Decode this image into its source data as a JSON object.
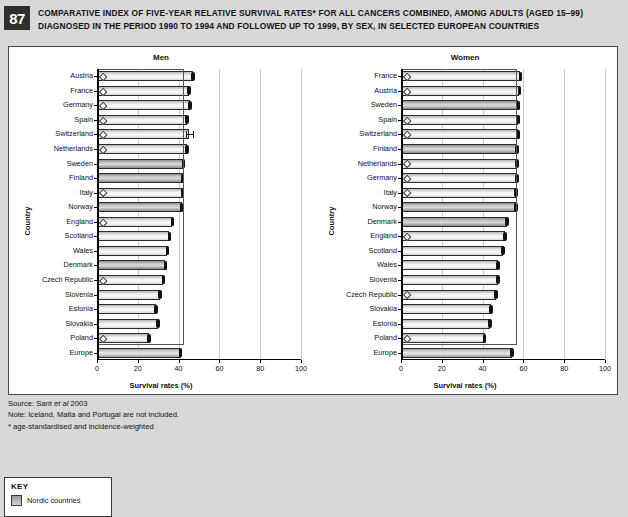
{
  "figure": {
    "number": "87",
    "title_line1": "COMPARATIVE INDEX OF FIVE-YEAR RELATIVE SURVIVAL RATES* FOR ALL CANCERS COMBINED, AMONG ADULTS (AGED 15–99)",
    "title_line2": "DIAGNOSED IN THE PERIOD 1990 TO 1994 AND FOLLOWED UP TO 1999, BY SEX, IN SELECTED EUROPEAN COUNTRIES"
  },
  "notes": {
    "source_prefix": "Source: Sant ",
    "source_italic": "et al",
    "source_suffix": " 2003",
    "note": "Note: Iceland, Malta and Portugal are not included.",
    "footnote": "* age-standardised and incidence-weighted"
  },
  "key": {
    "title": "KEY",
    "items": [
      {
        "label": "Nordic countries",
        "swatch": "#b0b0b0"
      }
    ]
  },
  "colors": {
    "page_background": "#d8d8d8",
    "panel_background": "#ffffff",
    "badge_background": "#2f2f2f",
    "gridline": "#c9c9c9",
    "axis": "#000000",
    "bar_outline": "#2b2b2b"
  },
  "chart_data": [
    {
      "type": "bar",
      "title": "Men",
      "xlabel": "Survival rates (%)",
      "ylabel": "Country",
      "xlim": [
        0,
        100
      ],
      "xticks": [
        0,
        20,
        40,
        60,
        80,
        100
      ],
      "grid": true,
      "orientation": "horizontal",
      "reference_line": 42.0,
      "categories": [
        "Austria",
        "France",
        "Germany",
        "Spain",
        "Switzerland",
        "Netherlands",
        "Sweden",
        "Finland",
        "Italy",
        "Norway",
        "England",
        "Scotland",
        "Wales",
        "Denmark",
        "Czech Republic",
        "Slovenia",
        "Estonia",
        "Slovakia",
        "Poland",
        "Europe"
      ],
      "values": [
        47.0,
        45.0,
        45.5,
        44.0,
        45.0,
        44.0,
        42.5,
        42.0,
        42.0,
        41.5,
        37.0,
        35.5,
        34.5,
        33.5,
        32.5,
        31.0,
        29.0,
        30.0,
        25.5,
        41.0
      ],
      "errors_low": [
        45.5,
        43.5,
        44.0,
        43.2,
        43.5,
        43.2,
        42.0,
        41.5,
        41.5,
        41.0,
        36.0,
        34.8,
        33.8,
        32.8,
        31.0,
        30.0,
        27.8,
        29.4,
        24.2,
        40.5
      ],
      "errors_high": [
        48.5,
        46.5,
        47.0,
        44.8,
        47.0,
        44.8,
        43.0,
        42.5,
        42.5,
        42.0,
        38.0,
        36.2,
        35.2,
        34.2,
        34.0,
        32.0,
        30.2,
        30.6,
        26.8,
        41.5
      ],
      "nordic": [
        "Sweden",
        "Finland",
        "Norway",
        "Denmark"
      ],
      "marked": [
        "Austria",
        "France",
        "Germany",
        "Spain",
        "Switzerland",
        "Netherlands",
        "Italy",
        "England",
        "Czech Republic",
        "Poland"
      ],
      "aggregate": "Europe"
    },
    {
      "type": "bar",
      "title": "Women",
      "xlabel": "Survival rates (%)",
      "ylabel": "Country",
      "xlim": [
        0,
        100
      ],
      "xticks": [
        0,
        20,
        40,
        60,
        80,
        100
      ],
      "grid": true,
      "orientation": "horizontal",
      "reference_line": 56.5,
      "categories": [
        "France",
        "Austria",
        "Sweden",
        "Spain",
        "Switzerland",
        "Finland",
        "Netherlands",
        "Germany",
        "Italy",
        "Norway",
        "Denmark",
        "England",
        "Scotland",
        "Wales",
        "Slovenia",
        "Czech Republic",
        "Slovakia",
        "Estonia",
        "Poland",
        "Europe"
      ],
      "values": [
        58.5,
        58.0,
        57.5,
        57.5,
        57.5,
        57.0,
        57.0,
        57.0,
        56.5,
        56.5,
        52.0,
        51.0,
        50.0,
        47.5,
        47.5,
        46.5,
        44.0,
        43.5,
        41.0,
        54.5
      ],
      "errors_low": [
        57.5,
        56.8,
        57.0,
        56.8,
        56.5,
        56.5,
        56.5,
        56.0,
        56.0,
        56.0,
        51.5,
        50.5,
        49.5,
        47.0,
        46.5,
        45.2,
        43.2,
        42.5,
        40.2,
        54.0
      ],
      "errors_high": [
        59.5,
        59.2,
        58.0,
        58.2,
        58.5,
        57.5,
        57.5,
        58.0,
        57.0,
        57.0,
        52.5,
        51.5,
        50.5,
        48.0,
        48.5,
        47.8,
        44.8,
        44.5,
        41.8,
        55.0
      ],
      "nordic": [
        "Sweden",
        "Finland",
        "Norway",
        "Denmark"
      ],
      "marked": [
        "France",
        "Austria",
        "Spain",
        "Switzerland",
        "Netherlands",
        "Germany",
        "Italy",
        "England",
        "Czech Republic",
        "Poland"
      ],
      "aggregate": "Europe"
    }
  ]
}
